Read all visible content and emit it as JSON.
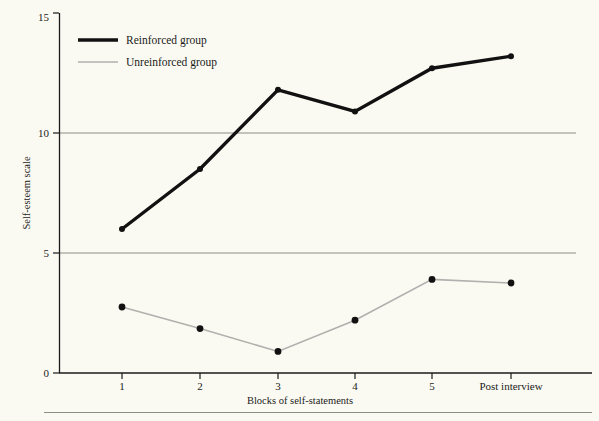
{
  "figure": {
    "background_color": "#fbfaf2",
    "ink_color": "#1a1a1a",
    "rule_color": "#8c8c84"
  },
  "axes": {
    "y_axis_title": "Self-esteem scale",
    "x_axis_title": "Blocks of self-statements",
    "y_ticks": [
      "0",
      "5",
      "10",
      "15"
    ],
    "x_ticks": [
      "1",
      "2",
      "3",
      "4",
      "5",
      "Post interview"
    ]
  },
  "legend": {
    "entries": [
      {
        "label": "Reinforced group",
        "color": "#111111",
        "line_width": "3.4"
      },
      {
        "label": "Unreinforced group",
        "color": "#b0b0ae",
        "line_width": "1.6"
      }
    ]
  },
  "chart_data": {
    "type": "line",
    "title": "",
    "subtitle": "",
    "xlabel": "Blocks of self-statements",
    "ylabel": "Self-esteem scale",
    "categories": [
      "1",
      "2",
      "3",
      "4",
      "5",
      "Post interview"
    ],
    "ylim": [
      0,
      15
    ],
    "yticks": [
      0,
      5,
      10,
      15
    ],
    "grid": "horizontal gridlines at y=5 and y=10 only",
    "legend_position": "inside top-left",
    "marker": "filled circle",
    "series": [
      {
        "name": "Reinforced group",
        "color": "#111111",
        "line_width": 3.4,
        "values": [
          6.0,
          8.5,
          11.8,
          10.9,
          12.7,
          13.2
        ]
      },
      {
        "name": "Unreinforced group",
        "color": "#b0b0ae",
        "line_width": 1.6,
        "values": [
          2.75,
          1.85,
          0.9,
          2.2,
          3.9,
          3.75
        ]
      }
    ]
  }
}
